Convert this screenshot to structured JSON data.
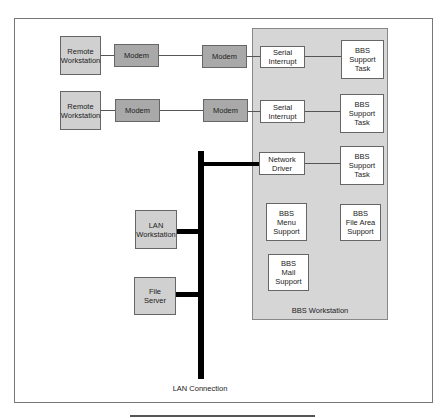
{
  "diagram": {
    "remote_workstations": [
      {
        "label": "Remote\nWorkstation"
      },
      {
        "label": "Remote\nWorkstation"
      }
    ],
    "modems_local": [
      {
        "label": "Modem"
      },
      {
        "label": "Modem"
      }
    ],
    "modems_remote": [
      {
        "label": "Modem"
      },
      {
        "label": "Modem"
      }
    ],
    "serial_interrupts": [
      {
        "label": "Serial\nInterrupt"
      },
      {
        "label": "Serial\nInterrupt"
      }
    ],
    "network_driver": {
      "label": "Network\nDriver"
    },
    "support_tasks": [
      {
        "label": "BBS\nSupport\nTask"
      },
      {
        "label": "BBS\nSupport\nTask"
      },
      {
        "label": "BBS\nSupport\nTask"
      }
    ],
    "menu_support": {
      "label": "BBS\nMenu\nSupport"
    },
    "file_area_support": {
      "label": "BBS\nFile Area\nSupport"
    },
    "mail_support": {
      "label": "BBS\nMail\nSupport"
    },
    "lan_workstation": {
      "label": "LAN\nWorkstation"
    },
    "file_server": {
      "label": "File\nServer"
    },
    "bbs_workstation_label": "BBS Workstation",
    "lan_connection_label": "LAN Connection"
  },
  "colors": {
    "panel": "#d6d6d6",
    "light_box": "#d0d0d0",
    "modem_box": "#a9a9a9",
    "bus": "#000000"
  }
}
